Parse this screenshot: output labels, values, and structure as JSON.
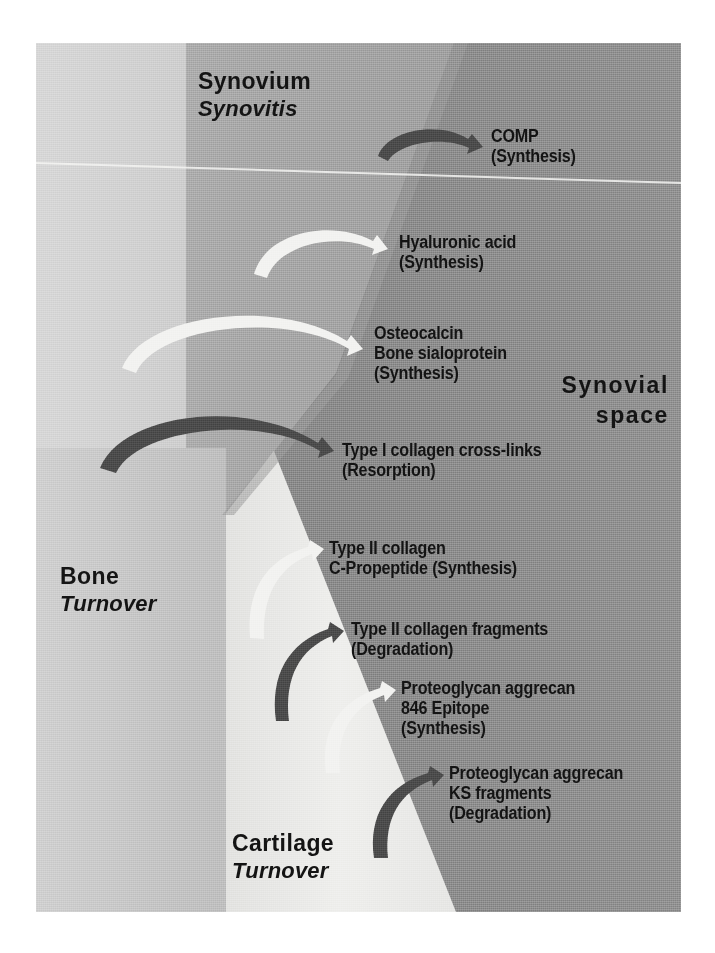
{
  "figure": {
    "kind": "biomedical-schematic",
    "palette": {
      "bone": "#c8c8c8",
      "cartilage": "#e8e8e6",
      "synovium": "#a8a8a8",
      "synovial_space": "#868686",
      "text": "#141414",
      "arrow_dark": "#4f4f4f",
      "arrow_light": "#f2f2f0",
      "page": "#ffffff"
    }
  },
  "tissues": [
    {
      "id": "synovium",
      "title": "Synovium",
      "subtitle": "Synovitis"
    },
    {
      "id": "bone",
      "title": "Bone",
      "subtitle": "Turnover"
    },
    {
      "id": "cartilage",
      "title": "Cartilage",
      "subtitle": "Turnover"
    }
  ],
  "compartment": {
    "line1": "Synovial",
    "line2": "space"
  },
  "markers": [
    {
      "id": "comp",
      "source": "synovium",
      "arrow": "dark",
      "lines": [
        "COMP",
        "(Synthesis)"
      ],
      "process": "Synthesis"
    },
    {
      "id": "hyaluronic-acid",
      "source": "synovium",
      "arrow": "light",
      "lines": [
        "Hyaluronic acid",
        "(Synthesis)"
      ],
      "process": "Synthesis"
    },
    {
      "id": "osteocalcin-bone-sialoprotein",
      "source": "bone",
      "arrow": "light",
      "lines": [
        "Osteocalcin",
        "Bone sialoprotein",
        "(Synthesis)"
      ],
      "process": "Synthesis"
    },
    {
      "id": "type-i-collagen-cross-links",
      "source": "bone",
      "arrow": "dark",
      "lines": [
        "Type I collagen cross-links",
        "(Resorption)"
      ],
      "process": "Resorption"
    },
    {
      "id": "type-ii-collagen-c-propeptide",
      "source": "cartilage",
      "arrow": "light",
      "lines": [
        "Type II collagen",
        "C-Propeptide (Synthesis)"
      ],
      "process": "Synthesis"
    },
    {
      "id": "type-ii-collagen-fragments",
      "source": "cartilage",
      "arrow": "dark",
      "lines": [
        "Type II collagen fragments",
        "(Degradation)"
      ],
      "process": "Degradation"
    },
    {
      "id": "proteoglycan-aggrecan-846-epitope",
      "source": "cartilage",
      "arrow": "light",
      "lines": [
        "Proteoglycan aggrecan",
        "846 Epitope",
        "(Synthesis)"
      ],
      "process": "Synthesis"
    },
    {
      "id": "proteoglycan-aggrecan-ks-fragments",
      "source": "cartilage",
      "arrow": "dark",
      "lines": [
        "Proteoglycan aggrecan",
        "KS fragments",
        "(Degradation)"
      ],
      "process": "Degradation"
    }
  ]
}
